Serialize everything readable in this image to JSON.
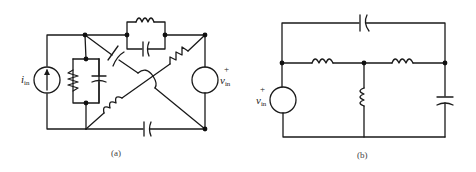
{
  "figure": {
    "diagram_a": {
      "caption": "(a)",
      "current_source_label": "i",
      "current_source_sub": "in",
      "voltage_source_label": "v",
      "voltage_source_sub": "in",
      "voltage_polarity": "+",
      "components": [
        "current-source",
        "resistor-parallel",
        "capacitor-parallel",
        "inductor-parallel-top",
        "capacitor-parallel-top",
        "capacitor-diagonal",
        "resistor-diagonal",
        "inductor-diagonal",
        "capacitor-bottom",
        "voltage-source"
      ]
    },
    "diagram_b": {
      "caption": "(b)",
      "voltage_source_label": "v",
      "voltage_source_sub": "in",
      "voltage_polarity": "+",
      "components": [
        "voltage-source",
        "capacitor-top",
        "inductor-series-1",
        "inductor-series-2",
        "inductor-shunt",
        "capacitor-shunt"
      ]
    }
  }
}
